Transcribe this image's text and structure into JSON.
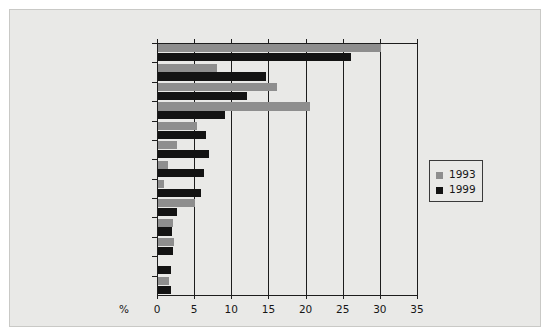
{
  "chart_data": {
    "type": "bar",
    "orientation": "horizontal",
    "title": "",
    "xlabel": "%",
    "ylabel": "",
    "xlim": [
      0,
      35
    ],
    "xticks": [
      0,
      5,
      10,
      15,
      20,
      25,
      30,
      35
    ],
    "grid": true,
    "legend_position": "right",
    "categories": [
      "France",
      "Australia",
      "Italy",
      "Germany",
      "Spain",
      "USA",
      "South Africa",
      "Chile",
      "Bulgaria",
      "Hungary",
      "Portugal",
      "Argentina",
      "New Zealand"
    ],
    "series": [
      {
        "name": "1993",
        "color": "#8e8e8e",
        "values": [
          30.0,
          8.0,
          16.0,
          20.5,
          5.3,
          2.5,
          1.3,
          0.8,
          5.0,
          2.0,
          2.2,
          0.0,
          1.5
        ]
      },
      {
        "name": "1999",
        "color": "#131313",
        "values": [
          26.0,
          14.5,
          12.0,
          9.0,
          6.5,
          6.8,
          6.2,
          5.8,
          2.6,
          1.9,
          2.0,
          1.8,
          1.8
        ]
      }
    ]
  },
  "legend": {
    "items": [
      {
        "label": "1993",
        "color": "#8e8e8e"
      },
      {
        "label": "1999",
        "color": "#131313"
      }
    ]
  }
}
